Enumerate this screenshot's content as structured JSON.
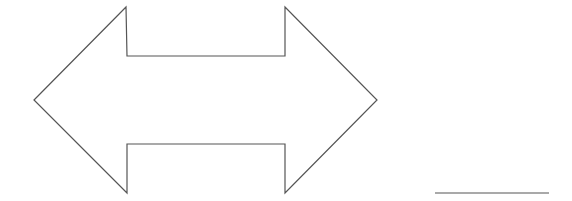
{
  "figure": {
    "width": 572,
    "height": 201,
    "background": "#ffffff",
    "stroke_color": "#555555",
    "stroke_width": 1.2
  },
  "shapes": {
    "double_arrow": {
      "type": "left-right-arrow",
      "fill": "#ffffff",
      "points": "34,100 126,7 127,56 285,56 285,7 377,100 285,193 285,144 127,144 127,193"
    },
    "answer_line": {
      "type": "line",
      "x1": 435,
      "y1": 193,
      "x2": 549,
      "y2": 193
    }
  }
}
